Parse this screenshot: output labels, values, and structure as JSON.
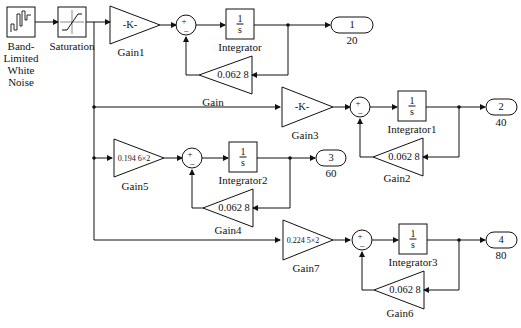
{
  "diagram": {
    "type": "Simulink block diagram",
    "blocks": {
      "noise": {
        "label_lines": [
          "Band-",
          "Limited",
          "White",
          "Noise"
        ]
      },
      "saturation": {
        "label": "Saturation"
      },
      "gain1": {
        "label": "Gain1",
        "value": "-K-"
      },
      "gain3": {
        "label": "Gain3",
        "value": "-K-"
      },
      "gain5": {
        "label": "Gain5",
        "value": "0.194 6×2"
      },
      "gain7": {
        "label": "Gain7",
        "value": "0.224 5×2"
      },
      "gain": {
        "label": "Gain",
        "value": "0.062 8"
      },
      "gain2": {
        "label": "Gain2",
        "value": "0.062 8"
      },
      "gain4": {
        "label": "Gain4",
        "value": "0.062 8"
      },
      "gain6": {
        "label": "Gain6",
        "value": "0.062 8"
      },
      "integrator": {
        "label": "Integrator",
        "num": "1",
        "den": "s"
      },
      "integrator1": {
        "label": "Integrator1",
        "num": "1",
        "den": "s"
      },
      "integrator2": {
        "label": "Integrator2",
        "num": "1",
        "den": "s"
      },
      "integrator3": {
        "label": "Integrator3",
        "num": "1",
        "den": "s"
      },
      "sum_signs": {
        "plus": "+",
        "minus": "−"
      },
      "out1": {
        "port": "1",
        "label": "20"
      },
      "out2": {
        "port": "2",
        "label": "40"
      },
      "out3": {
        "port": "3",
        "label": "60"
      },
      "out4": {
        "port": "4",
        "label": "80"
      }
    },
    "line_color": "#111111",
    "background": "#ffffff"
  }
}
